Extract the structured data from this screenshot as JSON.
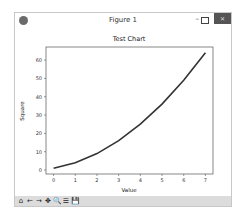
{
  "window": {
    "title": "Figure 1",
    "controls": {
      "minimize": "–",
      "maximize": "",
      "close": "✕"
    }
  },
  "toolbar": {
    "buttons": [
      {
        "name": "home",
        "glyph": "⌂"
      },
      {
        "name": "back",
        "glyph": "←"
      },
      {
        "name": "forward",
        "glyph": "→"
      },
      {
        "name": "pan",
        "glyph": "✥"
      },
      {
        "name": "zoom",
        "glyph": "🔍"
      },
      {
        "name": "subplots",
        "glyph": "☰"
      },
      {
        "name": "save",
        "glyph": "💾"
      }
    ]
  },
  "chart_data": {
    "type": "line",
    "title": "Test Chart",
    "xlabel": "Value",
    "ylabel": "Square",
    "x": [
      0,
      1,
      2,
      3,
      4,
      5,
      6,
      7
    ],
    "series": [
      {
        "name": "Square",
        "values": [
          1,
          4,
          9,
          16,
          25,
          36,
          49,
          64
        ],
        "color": "#333333"
      }
    ],
    "xticks": [
      "0",
      "1",
      "2",
      "3",
      "4",
      "5",
      "6",
      "7"
    ],
    "yticks": [
      "0",
      "10",
      "20",
      "30",
      "40",
      "50",
      "60"
    ],
    "xlim": [
      -0.35,
      7.35
    ],
    "ylim": [
      -2.15,
      67.15
    ],
    "grid": false,
    "legend": null
  }
}
